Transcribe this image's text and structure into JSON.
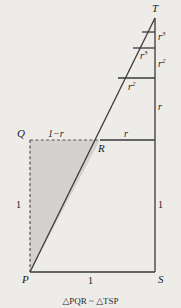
{
  "figure": {
    "type": "geometric-diagram",
    "background_color": "#eeece9",
    "line_color": "#3a3a3a",
    "shade_color": "#d4d2cf",
    "vertices": {
      "P": {
        "label": "P",
        "x": 30,
        "y": 272
      },
      "Q": {
        "label": "Q",
        "x": 30,
        "y": 140
      },
      "R": {
        "label": "R",
        "x": 100,
        "y": 140
      },
      "S": {
        "label": "S",
        "x": 155,
        "y": 272
      },
      "T": {
        "label": "T",
        "x": 155,
        "y": 18
      }
    },
    "segment_labels": {
      "base_bottom": "1",
      "side_left": "1",
      "side_right_lower": "1",
      "q_to_r": "1−r",
      "r_to_right": "r",
      "right_r": "r",
      "right_r2": "r",
      "right_r3": "r",
      "inner_r2": "r",
      "inner_r3": "r"
    },
    "exponents": {
      "right_r": "",
      "right_r2": "2",
      "right_r3": "3",
      "inner_r2": "2",
      "inner_r3": "3"
    },
    "caption": "△PQR ~ △TSP"
  }
}
